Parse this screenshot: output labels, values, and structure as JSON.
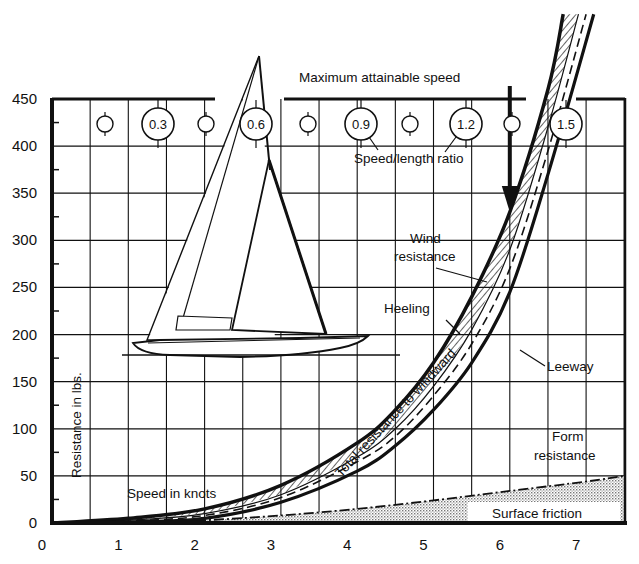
{
  "chart_data": {
    "type": "area",
    "title": "Maximum attainable speed",
    "subtitle": "Speed/length ratio",
    "xlabel": "Speed in knots",
    "ylabel": "Resistance in lbs.",
    "xlim": [
      0,
      7.5
    ],
    "ylim": [
      0,
      450
    ],
    "grid": true,
    "x_ticks": [
      "0",
      "1",
      "2",
      "3",
      "4",
      "5",
      "6",
      "7"
    ],
    "y_ticks": [
      "0",
      "50",
      "100",
      "150",
      "200",
      "250",
      "300",
      "350",
      "400",
      "450"
    ],
    "speed_length_ratio_markers": [
      "0.3",
      "0.6",
      "0.9",
      "1.2",
      "1.5"
    ],
    "max_speed_marker_knots": 6.0,
    "series": [
      {
        "name": "Total resistance to windward",
        "style": "thick solid (upper edge of hatched band)",
        "x": [
          0,
          1,
          2,
          3,
          4,
          4.5,
          5,
          5.5,
          6,
          6.5,
          6.7
        ],
        "values": [
          0,
          5,
          15,
          40,
          85,
          120,
          170,
          240,
          330,
          460,
          540
        ]
      },
      {
        "name": "Wind resistance / Heeling (hatched band lower edge)",
        "style": "hatched band",
        "x": [
          0,
          1,
          2,
          3,
          4,
          4.5,
          5,
          5.5,
          6,
          6.5,
          6.9
        ],
        "values": [
          0,
          3,
          10,
          30,
          70,
          100,
          145,
          205,
          290,
          420,
          540
        ]
      },
      {
        "name": "Leeway",
        "style": "dashed",
        "x": [
          0,
          1,
          2,
          3,
          4,
          4.5,
          5,
          5.5,
          6,
          6.5,
          7.0
        ],
        "values": [
          0,
          2,
          8,
          27,
          65,
          92,
          135,
          190,
          270,
          395,
          540
        ]
      },
      {
        "name": "Form resistance",
        "style": "thick solid",
        "x": [
          0,
          1,
          2,
          3,
          4,
          4.5,
          5,
          5.5,
          6,
          6.5,
          7.1
        ],
        "values": [
          0,
          1,
          5,
          22,
          55,
          82,
          120,
          170,
          245,
          370,
          540
        ]
      },
      {
        "name": "Surface friction",
        "style": "dot-dash, stippled fill",
        "x": [
          0,
          1,
          2,
          3,
          4,
          5,
          6,
          7,
          7.5
        ],
        "values": [
          0,
          1,
          3,
          8,
          15,
          24,
          34,
          44,
          50
        ]
      }
    ],
    "annotations": [
      "Maximum attainable speed",
      "Speed/length ratio",
      "Wind resistance",
      "Heeling",
      "Leeway",
      "Total resistance to windward",
      "Form resistance",
      "Surface friction",
      "Speed in knots",
      "Resistance in lbs."
    ]
  },
  "labels": {
    "title": "Maximum attainable speed",
    "ratio_caption": "Speed/length ratio",
    "wind": "Wind",
    "wind2": "resistance",
    "heeling": "Heeling",
    "leeway": "Leeway",
    "total": "Total resistance to windward",
    "form": "Form",
    "form2": "resistance",
    "friction": "Surface friction",
    "xlabel": "Speed in knots",
    "ylabel": "Resistance in lbs."
  }
}
